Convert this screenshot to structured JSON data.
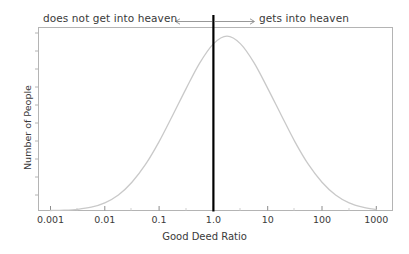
{
  "chart_data": {
    "type": "line",
    "title": "",
    "xlabel": "Good Deed Ratio",
    "ylabel": "Number of People",
    "xscale": "log",
    "xlim": [
      0.001,
      1000
    ],
    "ylim": [
      0,
      1
    ],
    "grid": false,
    "legend": null,
    "xticks": [
      0.001,
      0.01,
      0.1,
      1.0,
      10,
      100,
      1000
    ],
    "xticklabels": [
      "0.001",
      "0.01",
      "0.1",
      "1.0",
      "10",
      "100",
      "1000"
    ],
    "yticklabels": [],
    "series": [
      {
        "name": "population-distribution",
        "type": "line",
        "color": "#c9c9c9",
        "description": "log-normal bell curve of number of people versus good deed ratio, peak at ratio 1.0",
        "x": [
          0.001,
          0.00178,
          0.00316,
          0.00562,
          0.01,
          0.0178,
          0.0316,
          0.0562,
          0.1,
          0.178,
          0.316,
          0.562,
          1.0,
          1.78,
          3.16,
          5.62,
          10,
          17.8,
          31.6,
          56.2,
          100,
          178,
          316,
          562,
          1000
        ],
        "y": [
          0.0,
          0.002,
          0.007,
          0.019,
          0.044,
          0.089,
          0.162,
          0.264,
          0.395,
          0.546,
          0.7,
          0.846,
          0.955,
          0.999,
          0.955,
          0.846,
          0.7,
          0.546,
          0.395,
          0.264,
          0.162,
          0.089,
          0.044,
          0.019,
          0.005
        ]
      }
    ],
    "annotations": [
      {
        "name": "heaven-divider",
        "type": "vline",
        "x": 1.0,
        "color": "#000000",
        "linewidth": 2.2,
        "label": ""
      },
      {
        "name": "left-annotation",
        "type": "arrow-label",
        "text": "does not get into heaven",
        "direction": "left",
        "from_x": 1.0,
        "color": "#8c8c8c"
      },
      {
        "name": "right-annotation",
        "type": "arrow-label",
        "text": "gets into heaven",
        "direction": "right",
        "from_x": 1.0,
        "color": "#8c8c8c"
      }
    ]
  },
  "annotations": {
    "left_text": "does not get into heaven",
    "right_text": "gets into heaven"
  },
  "axes": {
    "xlabel": "Good Deed Ratio",
    "ylabel": "Number of People",
    "xticklabels": [
      "0.001",
      "0.01",
      "0.1",
      "1.0",
      "10",
      "100",
      "1000"
    ]
  },
  "colors": {
    "curve": "#c9c9c9",
    "divider": "#000000",
    "frame": "#b4b4b4",
    "text": "#3a3a3a",
    "arrow": "#8c8c8c",
    "background": "#ffffff"
  }
}
